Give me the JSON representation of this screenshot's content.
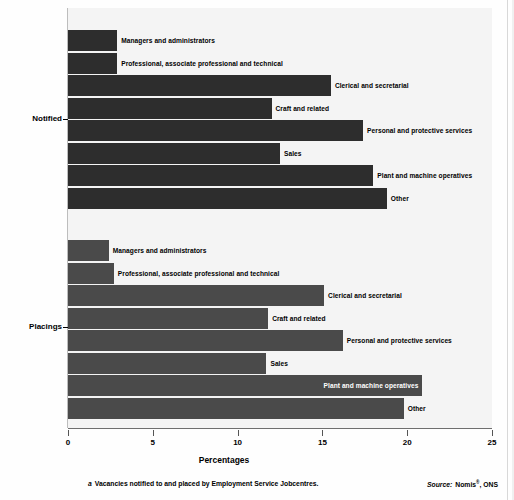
{
  "chart_data": {
    "type": "bar",
    "orientation": "horizontal",
    "title": "",
    "xlabel": "Percentages",
    "ylabel": "",
    "xlim": [
      0,
      25
    ],
    "xticks": [
      0,
      5,
      10,
      15,
      20,
      25
    ],
    "xtick_labels": [
      "0",
      "5",
      "10",
      "15",
      "20",
      "25"
    ],
    "grid": false,
    "legend": "none",
    "categories": [
      "Managers and administrators",
      "Professional, associate professional and technical",
      "Clerical and secretarial",
      "Craft and related",
      "Personal and protective services",
      "Sales",
      "Plant and machine operatives",
      "Other"
    ],
    "groups": [
      {
        "name": "Notified",
        "color": "#2d2d2d",
        "values": [
          2.9,
          2.9,
          15.5,
          12.0,
          17.4,
          12.5,
          18.0,
          18.8
        ]
      },
      {
        "name": "Placings",
        "color": "#4a4a4a",
        "values": [
          2.4,
          2.7,
          15.1,
          11.8,
          16.2,
          11.7,
          20.9,
          19.8
        ]
      }
    ]
  },
  "axis": {
    "x_title": "Percentages",
    "tick_labels": [
      "0",
      "5",
      "10",
      "15",
      "20",
      "25"
    ]
  },
  "groups": {
    "notified": {
      "label": "Notified",
      "bars": [
        {
          "label": "Managers and administrators",
          "value": 2.9,
          "label_inside": false
        },
        {
          "label": "Professional, associate professional and technical",
          "value": 2.9,
          "label_inside": false
        },
        {
          "label": "Clerical and secretarial",
          "value": 15.5,
          "label_inside": false
        },
        {
          "label": "Craft and related",
          "value": 12.0,
          "label_inside": false
        },
        {
          "label": "Personal and protective services",
          "value": 17.4,
          "label_inside": false
        },
        {
          "label": "Sales",
          "value": 12.5,
          "label_inside": false
        },
        {
          "label": "Plant and machine operatives",
          "value": 18.0,
          "label_inside": false
        },
        {
          "label": "Other",
          "value": 18.8,
          "label_inside": false
        }
      ]
    },
    "placings": {
      "label": "Placings",
      "bars": [
        {
          "label": "Managers and administrators",
          "value": 2.4,
          "label_inside": false
        },
        {
          "label": "Professional, associate professional and technical",
          "value": 2.7,
          "label_inside": false
        },
        {
          "label": "Clerical and secretarial",
          "value": 15.1,
          "label_inside": false
        },
        {
          "label": "Craft and related",
          "value": 11.8,
          "label_inside": false
        },
        {
          "label": "Personal and protective services",
          "value": 16.2,
          "label_inside": false
        },
        {
          "label": "Sales",
          "value": 11.7,
          "label_inside": false
        },
        {
          "label": "Plant and machine operatives",
          "value": 20.9,
          "label_inside": true
        },
        {
          "label": "Other",
          "value": 19.8,
          "label_inside": false
        }
      ]
    }
  },
  "footnote": {
    "marker": "a",
    "text": "Vacancies notified to and placed by Employment Service Jobcentres."
  },
  "source": {
    "lead": "Source:",
    "text": "Nomis",
    "superscript": "®",
    "suffix": ", ONS"
  },
  "colors": {
    "bar_notified": "#2d2d2d",
    "bar_placings": "#4a4a4a",
    "plot_background": "#f4f4f4",
    "page_background": "#fefefe",
    "axis": "#6e6e6e"
  }
}
